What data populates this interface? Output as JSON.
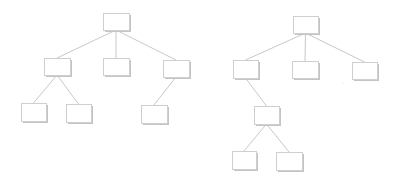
{
  "diagram": {
    "type": "tree-comparison",
    "colors": {
      "edge": "#c8c8c8",
      "node_border": "#cfcfcf",
      "node_shadow": "#c4c4c4",
      "background": "#ffffff"
    },
    "trees": [
      {
        "name": "left-tree",
        "nodes": [
          {
            "id": "a",
            "x": 103,
            "y": 13,
            "w": 26,
            "h": 17
          },
          {
            "id": "b",
            "x": 44,
            "y": 58,
            "w": 26,
            "h": 17
          },
          {
            "id": "c",
            "x": 103,
            "y": 58,
            "w": 26,
            "h": 17
          },
          {
            "id": "d",
            "x": 163,
            "y": 60,
            "w": 26,
            "h": 17
          },
          {
            "id": "e",
            "x": 21,
            "y": 103,
            "w": 25,
            "h": 18
          },
          {
            "id": "f",
            "x": 66,
            "y": 104,
            "w": 25,
            "h": 18
          },
          {
            "id": "g",
            "x": 141,
            "y": 105,
            "w": 26,
            "h": 18
          }
        ],
        "edges": [
          [
            "a",
            "b"
          ],
          [
            "a",
            "c"
          ],
          [
            "a",
            "d"
          ],
          [
            "b",
            "e"
          ],
          [
            "b",
            "f"
          ],
          [
            "d",
            "g"
          ]
        ]
      },
      {
        "name": "right-tree",
        "nodes": [
          {
            "id": "h",
            "x": 293,
            "y": 16,
            "w": 25,
            "h": 17
          },
          {
            "id": "i",
            "x": 233,
            "y": 60,
            "w": 25,
            "h": 18
          },
          {
            "id": "j",
            "x": 292,
            "y": 61,
            "w": 26,
            "h": 17
          },
          {
            "id": "k",
            "x": 352,
            "y": 62,
            "w": 25,
            "h": 17
          },
          {
            "id": "l",
            "x": 254,
            "y": 106,
            "w": 25,
            "h": 18
          },
          {
            "id": "m",
            "x": 232,
            "y": 151,
            "w": 24,
            "h": 18
          },
          {
            "id": "n",
            "x": 276,
            "y": 152,
            "w": 26,
            "h": 18
          }
        ],
        "edges": [
          [
            "h",
            "i"
          ],
          [
            "h",
            "j"
          ],
          [
            "h",
            "k"
          ],
          [
            "i",
            "l"
          ],
          [
            "l",
            "m"
          ],
          [
            "l",
            "n"
          ]
        ]
      }
    ]
  }
}
